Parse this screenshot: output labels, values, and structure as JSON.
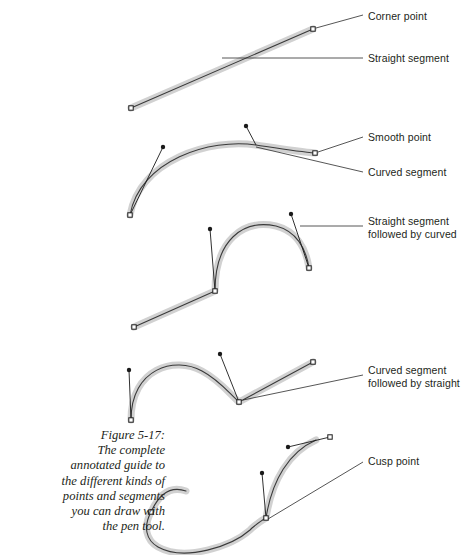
{
  "figure": {
    "caption": "Figure 5-17:\nThe complete\nannotated guide to\nthe different kinds of\npoints and segments\nyou can draw with\nthe pen tool.",
    "caption_number": "Figure 5-17:",
    "colors": {
      "path_halo": "#c9c9c9",
      "path_stroke": "#3a3a3a",
      "anchor_fill": "#ffffff",
      "anchor_stroke": "#1a1a1a",
      "handle_dot": "#1a1a1a",
      "leader_line": "#2b2b2b",
      "text": "#231f20",
      "background": "#ffffff"
    }
  },
  "annotations": [
    {
      "id": "corner-point",
      "text": "Corner point",
      "x": 368,
      "y": 10
    },
    {
      "id": "straight-segment",
      "text": "Straight segment",
      "x": 368,
      "y": 52
    },
    {
      "id": "smooth-point",
      "text": "Smooth point",
      "x": 368,
      "y": 131
    },
    {
      "id": "curved-segment",
      "text": "Curved segment",
      "x": 368,
      "y": 166
    },
    {
      "id": "straight-then-curved",
      "text": "Straight segment\nfollowed by curved",
      "x": 368,
      "y": 215
    },
    {
      "id": "curved-then-straight",
      "text": "Curved segment\nfollowed by straight",
      "x": 368,
      "y": 364
    },
    {
      "id": "cusp-point",
      "text": "Cusp point",
      "x": 368,
      "y": 455
    }
  ],
  "paths": [
    {
      "id": "path-straight",
      "kind": "straight segment with two corner points",
      "d": "M 131 108 L 313 29",
      "anchors": [
        {
          "x": 131,
          "y": 108,
          "type": "corner"
        },
        {
          "x": 313,
          "y": 29,
          "type": "corner"
        }
      ],
      "handles": []
    },
    {
      "id": "path-curved",
      "kind": "curved segment between smooth points",
      "d": "M 130 215 C 140 160 210 138 256 145 C 282 149 300 152 315 153",
      "anchors": [
        {
          "x": 130,
          "y": 215,
          "type": "smooth"
        },
        {
          "x": 315,
          "y": 153,
          "type": "smooth"
        }
      ],
      "handles": [
        {
          "from_x": 130,
          "from_y": 215,
          "to_x": 163,
          "to_y": 147
        },
        {
          "from_x": 256,
          "from_y": 145,
          "to_x": 246,
          "to_y": 126
        }
      ]
    },
    {
      "id": "path-straight-then-curved",
      "kind": "straight segment followed by curved",
      "d": "M 134 327 L 215 291 C 215 240 243 219 276 226 C 296 231 306 248 309 268",
      "anchors": [
        {
          "x": 134,
          "y": 327,
          "type": "corner"
        },
        {
          "x": 215,
          "y": 291,
          "type": "cusp"
        },
        {
          "x": 309,
          "y": 268,
          "type": "smooth"
        }
      ],
      "handles": [
        {
          "from_x": 215,
          "from_y": 291,
          "to_x": 210,
          "to_y": 229
        },
        {
          "from_x": 309,
          "from_y": 268,
          "to_x": 291,
          "to_y": 214
        }
      ]
    },
    {
      "id": "path-curved-then-straight",
      "kind": "curved segment followed by straight",
      "d": "M 131 420 C 131 368 175 356 202 371 C 219 380 228 392 239 402 L 313 362",
      "anchors": [
        {
          "x": 131,
          "y": 420,
          "type": "smooth"
        },
        {
          "x": 239,
          "y": 402,
          "type": "cusp"
        },
        {
          "x": 313,
          "y": 362,
          "type": "corner"
        }
      ],
      "handles": [
        {
          "from_x": 131,
          "from_y": 420,
          "to_x": 129,
          "to_y": 370
        },
        {
          "from_x": 239,
          "from_y": 402,
          "to_x": 220,
          "to_y": 354
        }
      ]
    },
    {
      "id": "path-cusp",
      "kind": "cusp point joining two curves",
      "d": "M 151 512 C 160 492 172 486 186 491 M 151 512 C 143 527 146 540 158 547 C 185 562 232 546 250 530 L 252 528 C 258 523 262 520 266 518 M 266 518 C 272 480 289 452 316 440",
      "anchors": [
        {
          "x": 151,
          "y": 512,
          "type": "smooth"
        },
        {
          "x": 266,
          "y": 518,
          "type": "cusp"
        },
        {
          "x": 330,
          "y": 437,
          "type": "smooth"
        }
      ],
      "handles": [
        {
          "from_x": 266,
          "from_y": 518,
          "to_x": 262,
          "to_y": 473
        },
        {
          "from_x": 330,
          "from_y": 437,
          "to_x": 288,
          "to_y": 447
        }
      ]
    }
  ],
  "leaders": [
    {
      "id": "leader-corner-point",
      "d": "M 316 28 L 363 15"
    },
    {
      "id": "leader-straight-segment",
      "d": "M 222 58 L 363 58"
    },
    {
      "id": "leader-smooth-point",
      "d": "M 318 152 L 363 137"
    },
    {
      "id": "leader-curved-segment",
      "d": "M 256 147 L 363 172"
    },
    {
      "id": "leader-straight-then-curved",
      "d": "M 300 226 L 363 226"
    },
    {
      "id": "leader-curved-then-straight",
      "d": "M 243 400 L 363 375"
    },
    {
      "id": "leader-cusp-point",
      "d": "M 268 519 L 363 462"
    }
  ]
}
